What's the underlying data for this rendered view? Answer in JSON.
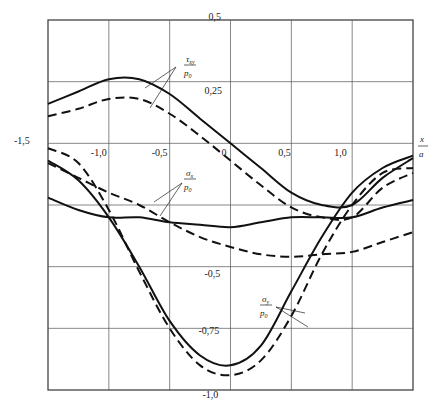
{
  "chart_data": {
    "type": "line",
    "title": "",
    "xlabel": "x/a",
    "ylabel": "",
    "xlim": [
      -1.5,
      1.5
    ],
    "ylim": [
      -1.0,
      0.5
    ],
    "grid": true,
    "x_ticks": [
      "-1,5",
      "-1,0",
      "-0,5",
      "0",
      "0,5",
      "1,0"
    ],
    "y_ticks": [
      "0,5",
      "0,25",
      "-0,5",
      "-0,75",
      "-1,0"
    ],
    "x": [
      -1.5,
      -1.25,
      -1.0,
      -0.75,
      -0.5,
      -0.25,
      0,
      0.25,
      0.5,
      0.75,
      1.0,
      1.25,
      1.5
    ],
    "series": [
      {
        "name": "τxy/p0 (solid)",
        "style": "solid",
        "values": [
          0.16,
          0.21,
          0.26,
          0.26,
          0.2,
          0.1,
          0.0,
          -0.1,
          -0.2,
          -0.25,
          -0.25,
          -0.14,
          -0.06
        ]
      },
      {
        "name": "τxy/p0 (dashed)",
        "style": "dashed",
        "values": [
          0.11,
          0.14,
          0.18,
          0.18,
          0.12,
          0.03,
          -0.07,
          -0.17,
          -0.26,
          -0.3,
          -0.3,
          -0.18,
          -0.12
        ]
      },
      {
        "name": "σx/p0 (solid)",
        "style": "solid",
        "values": [
          -0.22,
          -0.27,
          -0.3,
          -0.3,
          -0.32,
          -0.33,
          -0.34,
          -0.32,
          -0.3,
          -0.3,
          -0.3,
          -0.26,
          -0.23
        ]
      },
      {
        "name": "σx/p0 (dashed)",
        "style": "dashed",
        "values": [
          -0.08,
          -0.14,
          -0.2,
          -0.25,
          -0.32,
          -0.38,
          -0.42,
          -0.45,
          -0.46,
          -0.45,
          -0.44,
          -0.4,
          -0.36
        ]
      },
      {
        "name": "σy/p0 (solid)",
        "style": "solid",
        "values": [
          -0.07,
          -0.15,
          -0.3,
          -0.5,
          -0.72,
          -0.86,
          -0.9,
          -0.82,
          -0.6,
          -0.38,
          -0.2,
          -0.1,
          -0.05
        ]
      },
      {
        "name": "σy/p0 (dashed)",
        "style": "dashed",
        "values": [
          -0.02,
          -0.08,
          -0.27,
          -0.52,
          -0.75,
          -0.9,
          -0.94,
          -0.88,
          -0.7,
          -0.45,
          -0.25,
          -0.12,
          -0.1
        ]
      }
    ],
    "annotations": [
      {
        "text_num": "τxy",
        "text_den": "p0"
      },
      {
        "text_num": "σx",
        "text_den": "p0"
      },
      {
        "text_num": "σy",
        "text_den": "p0"
      }
    ]
  },
  "labels": {
    "tau_num": "τ",
    "tau_sub": "xy",
    "tau_den": "p",
    "tau_den_sub": "0",
    "sx_num": "σ",
    "sx_sub": "x",
    "sx_den": "p",
    "sx_den_sub": "0",
    "sy_num": "σ",
    "sy_sub": "y",
    "sy_den": "p",
    "sy_den_sub": "0",
    "xaxis_num": "x",
    "xaxis_den": "a"
  }
}
